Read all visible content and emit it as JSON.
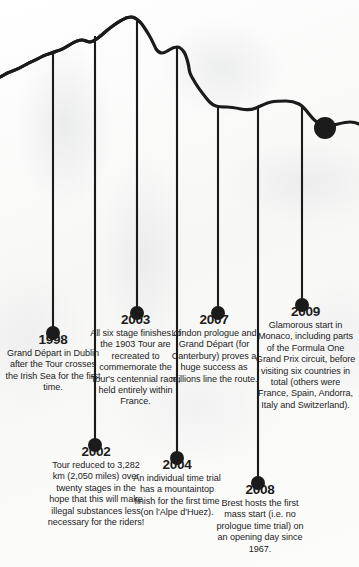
{
  "graphic": {
    "type": "mountain-profile-timeline",
    "title": "Tour de France timeline over mountain elevation profile",
    "ink_color": "#1b1b1b",
    "paper_color": "#fbfbfa",
    "end_marker": {
      "name": "finish-dot",
      "x": 325,
      "y": 128
    }
  },
  "events": [
    {
      "year": "1998",
      "description": "Grand Départ in Dublin after the Tour crosses the Irish Sea for the first time.",
      "row": "upper",
      "stem_x": 53,
      "dot_y": 333
    },
    {
      "year": "2002",
      "description": "Tour reduced to 3,282 km (2,050 miles) over twenty stages in the hope that this will make illegal substances less necessary for the riders!",
      "row": "lower",
      "stem_x": 95,
      "dot_y": 445
    },
    {
      "year": "2003",
      "description": "All six stage finishes of the 1903 Tour are recreated to commemorate the Tour's centennial race, held entirely within France.",
      "row": "upper",
      "stem_x": 137,
      "dot_y": 313
    },
    {
      "year": "2004",
      "description": "An individual time trial has a mountaintop finish for the first time (on l'Alpe d'Huez).",
      "row": "lower",
      "stem_x": 177,
      "dot_y": 458
    },
    {
      "year": "2007",
      "description": "London prologue and Grand Départ (for Canterbury) proves a huge success as millions line the route.",
      "row": "upper",
      "stem_x": 218,
      "dot_y": 313
    },
    {
      "year": "2008",
      "description": "Brest hosts the first mass start (i.e. no prologue time trial) on an opening day since 1967.",
      "row": "lower",
      "stem_x": 258,
      "dot_y": 483
    },
    {
      "year": "2009",
      "description": "Glamorous start in Monaco, including parts of the Formula One Grand Prix circuit, before visiting six countries in total (others were France, Spain, Andorra, Italy and Switzerland).",
      "row": "upper",
      "stem_x": 302,
      "dot_y": 305
    }
  ]
}
